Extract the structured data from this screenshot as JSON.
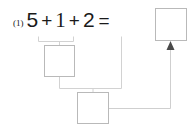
{
  "worksheet": {
    "problem_number": "(1)",
    "equation": {
      "term1": "5",
      "op1": "+",
      "term2": "1",
      "op2": "+",
      "term3": "2",
      "equals": "="
    },
    "boxes": [
      {
        "name": "result-box",
        "value": ""
      },
      {
        "name": "step1-box",
        "value": ""
      },
      {
        "name": "step2-box",
        "value": ""
      }
    ],
    "connectors": {
      "bracket1_label": "bracket under 5 + 1",
      "bracket2_label": "bracket joining step1 box and third term",
      "arrow_label": "arrow into result box"
    },
    "colors": {
      "text": "#1a1a1a",
      "box_border": "#b9b9b9",
      "connector_line": "#cfcfcf",
      "arrow": "#4a4a4a",
      "background": "#ffffff"
    }
  }
}
